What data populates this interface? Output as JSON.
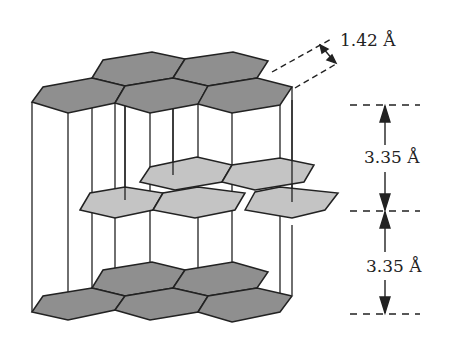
{
  "diagram": {
    "colors": {
      "dark_layer": "#8f8f8f",
      "light_layer": "#c4c4c4",
      "stroke": "#222222",
      "background": "#ffffff"
    },
    "layers": [
      {
        "name": "top-layer-A",
        "shade": "dark"
      },
      {
        "name": "middle-layer-B",
        "shade": "light"
      },
      {
        "name": "bottom-layer-A",
        "shade": "dark"
      }
    ],
    "annotations": {
      "bond_length": "1.42 Å",
      "interlayer_spacing_top": "3.35 Å",
      "interlayer_spacing_bottom": "3.35 Å"
    }
  }
}
